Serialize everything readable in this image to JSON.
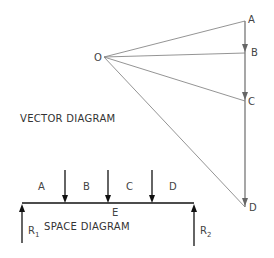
{
  "vector_diagram": {
    "title": "VECTOR DIAGRAM",
    "pole_label": "O",
    "points": [
      {
        "label": "A"
      },
      {
        "label": "B"
      },
      {
        "label": "C"
      },
      {
        "label": "D"
      }
    ]
  },
  "space_diagram": {
    "title": "SPACE DIAGRAM",
    "space_labels": [
      "A",
      "B",
      "C",
      "D"
    ],
    "below_beam_label": "E",
    "reactions": [
      {
        "label": "R",
        "sub": "1"
      },
      {
        "label": "R",
        "sub": "2"
      }
    ]
  },
  "colors": {
    "vector_lines": "#777777",
    "beam": "#111111",
    "text": "#444444"
  }
}
